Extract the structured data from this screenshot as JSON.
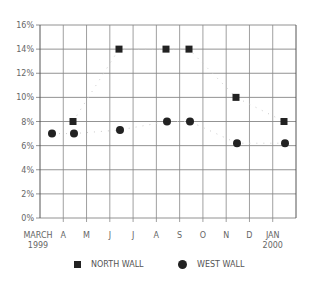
{
  "chart_data": {
    "type": "scatter",
    "title": "",
    "xlabel": "",
    "ylabel": "",
    "ylim": [
      0,
      16
    ],
    "yticks": [
      "0%",
      "2%",
      "4%",
      "6%",
      "8%",
      "10%",
      "12%",
      "14%",
      "16%"
    ],
    "categories": [
      "MARCH 1999",
      "A",
      "M",
      "J",
      "J",
      "A",
      "S",
      "O",
      "N",
      "D",
      "JAN 2000"
    ],
    "grid": true,
    "legend_position": "bottom",
    "series": [
      {
        "name": "NORTH WALL",
        "marker": "square",
        "color": "#222222",
        "points": [
          {
            "x": "A",
            "y": 8
          },
          {
            "x": "J",
            "y": 14
          },
          {
            "x": "A",
            "y": 14
          },
          {
            "x": "S",
            "y": 14
          },
          {
            "x": "N",
            "y": 10
          },
          {
            "x": "JAN 2000",
            "y": 8
          }
        ]
      },
      {
        "name": "WEST WALL",
        "marker": "circle",
        "color": "#222222",
        "points": [
          {
            "x": "MARCH 1999",
            "y": 7
          },
          {
            "x": "A",
            "y": 7
          },
          {
            "x": "J",
            "y": 7.3
          },
          {
            "x": "A",
            "y": 8
          },
          {
            "x": "S",
            "y": 8
          },
          {
            "x": "N",
            "y": 6.2
          },
          {
            "x": "JAN 2000",
            "y": 6.2
          }
        ]
      }
    ]
  },
  "legend": {
    "north": "NORTH WALL",
    "west": "WEST WALL"
  },
  "axis": {
    "x_first_line1": "MARCH",
    "x_first_line2": "1999",
    "x_last_line1": "JAN",
    "x_last_line2": "2000",
    "x_mid": [
      "A",
      "M",
      "J",
      "J",
      "A",
      "S",
      "O",
      "N",
      "D"
    ]
  }
}
